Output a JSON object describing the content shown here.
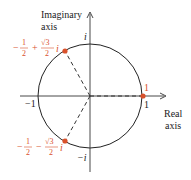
{
  "diagram": {
    "type": "complex-plane-unit-circle",
    "axes": {
      "imaginary_label_line1": "Imaginary",
      "imaginary_label_line2": "axis",
      "real_label_line1": "Real",
      "real_label_line2": "axis"
    },
    "intercepts": {
      "top": "i",
      "bottom": "−i",
      "left": "−1",
      "right": "1"
    },
    "points": [
      {
        "name": "one",
        "label": "1",
        "re": 1,
        "im": 0
      },
      {
        "name": "upper-root",
        "label": "−½ + √3⁄2 i",
        "sign": "−",
        "half_num": "1",
        "half_den": "2",
        "op": "+",
        "root_num": "√3",
        "root_den": "2",
        "unit": "i",
        "re": -0.5,
        "im": 0.866
      },
      {
        "name": "lower-root",
        "label": "−½ − √3⁄2 i",
        "sign": "−",
        "half_num": "1",
        "half_den": "2",
        "op": "−",
        "root_num": "√3",
        "root_den": "2",
        "unit": "i",
        "re": -0.5,
        "im": -0.866
      }
    ],
    "colors": {
      "axis": "#333333",
      "circle": "#222222",
      "point": "#d9512b",
      "point_label": "#d9512b",
      "dashed": "#333333"
    }
  }
}
